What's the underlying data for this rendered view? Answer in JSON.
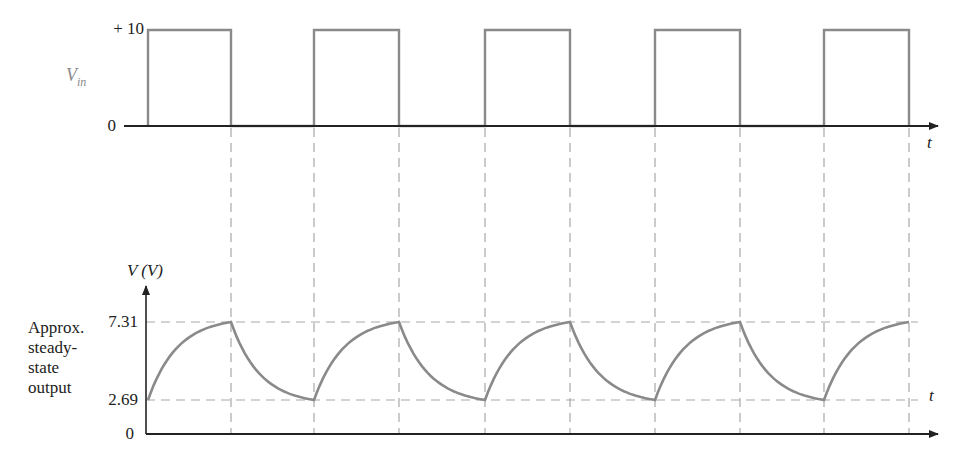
{
  "top_plot": {
    "y_label": "V",
    "y_label_sub": "in",
    "ticks": [
      {
        "label": "+ 10",
        "value": 10
      },
      {
        "label": "0",
        "value": 0
      }
    ],
    "x_label": "t"
  },
  "bottom_plot": {
    "y_label": "V (V)",
    "ticks": [
      {
        "label": "7.31",
        "value": 7.31
      },
      {
        "label": "2.69",
        "value": 2.69
      },
      {
        "label": "0",
        "value": 0
      }
    ],
    "x_label": "t",
    "annotation": "Approx.\nsteady-\nstate\noutput"
  },
  "colors": {
    "signal": "#8a8a8a",
    "axis": "#333333",
    "guide": "#a8a8a8",
    "text": "#222222"
  },
  "chart_data": [
    {
      "type": "line",
      "title": "Input square wave",
      "ylabel": "V_in",
      "xlabel": "t",
      "ylim": [
        0,
        10
      ],
      "yticks": [
        0,
        10
      ],
      "series": [
        {
          "name": "V_in",
          "description": "Square wave, 50% duty cycle, 0 to +10 V, 5 pulses shown",
          "x": [
            0,
            0,
            1,
            1,
            2,
            2,
            3,
            3,
            4,
            4,
            5,
            5,
            6,
            6,
            7,
            7,
            8,
            8,
            9,
            9,
            10
          ],
          "values": [
            0,
            10,
            10,
            0,
            0,
            10,
            10,
            0,
            0,
            10,
            10,
            0,
            0,
            10,
            10,
            0,
            0,
            10,
            10,
            0,
            0
          ]
        }
      ],
      "grid": false,
      "x_unit": "half-periods"
    },
    {
      "type": "line",
      "title": "Approx. steady-state output",
      "ylabel": "V (V)",
      "xlabel": "t",
      "ylim": [
        0,
        7.31
      ],
      "yticks": [
        0,
        2.69,
        7.31
      ],
      "annotations": [
        "Approx. steady-state output",
        "dashed guide lines at 2.69 V and 7.31 V",
        "dashed vertical lines at each input transition"
      ],
      "series": [
        {
          "name": "V_out",
          "description": "Exponential charge from 2.69 V to 7.31 V during input high, exponential discharge from 7.31 V to 2.69 V during input low",
          "x": [
            0,
            1,
            2,
            3,
            4,
            5,
            6,
            7,
            8,
            9
          ],
          "values": [
            2.69,
            7.31,
            2.69,
            7.31,
            2.69,
            7.31,
            2.69,
            7.31,
            2.69,
            7.31
          ]
        }
      ],
      "grid": false,
      "x_unit": "half-periods"
    }
  ]
}
